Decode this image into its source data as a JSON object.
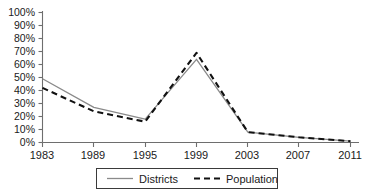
{
  "chart_data": {
    "type": "line",
    "title": "",
    "xlabel": "",
    "ylabel": "",
    "categories": [
      "1983",
      "1989",
      "1995",
      "1999",
      "2003",
      "2007",
      "2011"
    ],
    "x": [
      1983,
      1989,
      1995,
      1999,
      2003,
      2007,
      2011
    ],
    "series": [
      {
        "name": "Districts",
        "style": "solid",
        "color": "#8a8a8a",
        "values": [
          49,
          27,
          18,
          64,
          8,
          4,
          1
        ]
      },
      {
        "name": "Population",
        "style": "dashed",
        "color": "#111111",
        "values": [
          42,
          24,
          16,
          69,
          8,
          4,
          1
        ]
      }
    ],
    "ylim": [
      0,
      100
    ],
    "ytick_values": [
      0,
      10,
      20,
      30,
      40,
      50,
      60,
      70,
      80,
      90,
      100
    ],
    "ytick_labels": [
      "0%",
      "10%",
      "20%",
      "30%",
      "40%",
      "50%",
      "60%",
      "70%",
      "80%",
      "90%",
      "100%"
    ],
    "xtick_labels": [
      "1983",
      "1989",
      "1995",
      "1999",
      "2003",
      "2007",
      "2011"
    ],
    "grid": false,
    "legend_position": "bottom",
    "legend_entries": [
      "Districts",
      "Population"
    ],
    "axis_color": "#6e6e6e",
    "background_color": "#ffffff"
  },
  "legend": {
    "districts_label": "Districts",
    "population_label": "Population"
  },
  "yaxis": {
    "t0": "0%",
    "t1": "10%",
    "t2": "20%",
    "t3": "30%",
    "t4": "40%",
    "t5": "50%",
    "t6": "60%",
    "t7": "70%",
    "t8": "80%",
    "t9": "90%",
    "t10": "100%"
  },
  "xaxis": {
    "t0": "1983",
    "t1": "1989",
    "t2": "1995",
    "t3": "1999",
    "t4": "2003",
    "t5": "2007",
    "t6": "2011"
  }
}
